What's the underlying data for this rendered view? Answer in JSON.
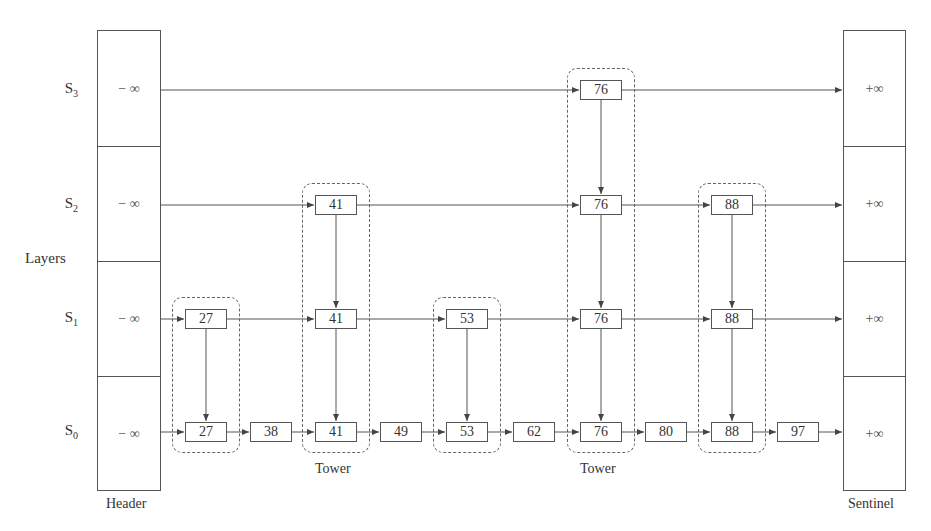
{
  "diagram": {
    "y_axis_label": "Layers",
    "header": {
      "label": "Header",
      "value": "− ∞"
    },
    "sentinel": {
      "label": "Sentinel",
      "value": "+∞"
    },
    "layers": [
      {
        "name": "S",
        "sub": "3",
        "keys": [
          76
        ]
      },
      {
        "name": "S",
        "sub": "2",
        "keys": [
          41,
          76,
          88
        ]
      },
      {
        "name": "S",
        "sub": "1",
        "keys": [
          27,
          41,
          53,
          76,
          88
        ]
      },
      {
        "name": "S",
        "sub": "0",
        "keys": [
          27,
          38,
          41,
          49,
          53,
          62,
          76,
          80,
          88,
          97
        ]
      }
    ],
    "towers": [
      {
        "key": 27,
        "height": 2,
        "label": ""
      },
      {
        "key": 41,
        "height": 3,
        "label": "Tower"
      },
      {
        "key": 53,
        "height": 2,
        "label": ""
      },
      {
        "key": 76,
        "height": 4,
        "label": "Tower"
      },
      {
        "key": 88,
        "height": 3,
        "label": ""
      }
    ],
    "tower_label": "Tower",
    "colors": {
      "line": "#555555",
      "text": "#333333",
      "dashed": "#666666"
    }
  }
}
